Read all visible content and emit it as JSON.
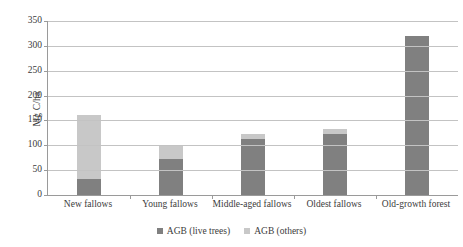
{
  "chart_data": {
    "type": "bar",
    "stacked": true,
    "title": "",
    "subtitle": "",
    "xlabel": "",
    "ylabel": "Mg C/ha",
    "ylim": [
      0,
      350
    ],
    "yticks": [
      0,
      50,
      100,
      150,
      200,
      250,
      300,
      350
    ],
    "ytick_labels": [
      "0",
      "50",
      "100",
      "150",
      "200",
      "250",
      "300",
      "350"
    ],
    "grid": true,
    "legend_position": "bottom",
    "categories": [
      "New fallows",
      "Young fallows",
      "Middle-aged fallows",
      "Oldest fallows",
      "Old-growth forest"
    ],
    "series": [
      {
        "name": "AGB (live trees)",
        "color": "#808080",
        "values": [
          33,
          73,
          113,
          122,
          320
        ]
      },
      {
        "name": "AGB (others)",
        "color": "#c8c8c8",
        "values": [
          127,
          26,
          9,
          11,
          0
        ]
      }
    ],
    "totals": [
      160,
      99,
      122,
      133,
      320
    ]
  },
  "legend": {
    "entries": [
      {
        "label": "AGB (live trees)",
        "color": "#808080"
      },
      {
        "label": "AGB (others)",
        "color": "#c8c8c8"
      }
    ]
  },
  "axis": {
    "y_title": "Mg C/ha"
  },
  "colors": {
    "live_trees": "#808080",
    "others": "#c8c8c8",
    "gridline": "#c3c3c3",
    "axis_line": "#9a9a9a",
    "text": "#3b3b3b",
    "background": "#ffffff"
  }
}
